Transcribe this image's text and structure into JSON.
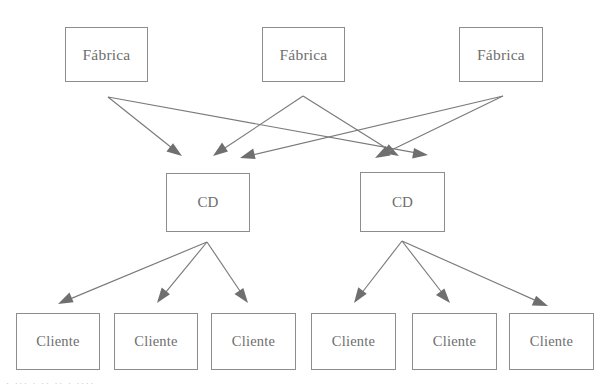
{
  "diagram": {
    "type": "supply-chain-network",
    "title": "",
    "canvas": {
      "width": 614,
      "height": 392,
      "background": "#ffffff"
    },
    "style": {
      "box_border_color": "#8d8d8d",
      "box_fill_color": "#ffffff",
      "text_color": "#6e6e6e",
      "edge_color": "#7a7a7a",
      "arrowhead_color": "#6f6f6f"
    },
    "tiers": [
      {
        "name": "factories",
        "label_singular": "Fábrica",
        "nodes": [
          {
            "id": "f1",
            "label": "Fábrica",
            "x": 65,
            "y": 27,
            "w": 83,
            "h": 55
          },
          {
            "id": "f2",
            "label": "Fábrica",
            "x": 262,
            "y": 27,
            "w": 83,
            "h": 55
          },
          {
            "id": "f3",
            "label": "Fábrica",
            "x": 459,
            "y": 27,
            "w": 84,
            "h": 55
          }
        ]
      },
      {
        "name": "distribution_centers",
        "label_singular": "CD",
        "nodes": [
          {
            "id": "cd1",
            "label": "CD",
            "x": 166,
            "y": 173,
            "w": 84,
            "h": 59
          },
          {
            "id": "cd2",
            "label": "CD",
            "x": 360,
            "y": 172,
            "w": 85,
            "h": 60
          }
        ]
      },
      {
        "name": "customers",
        "label_singular": "Cliente",
        "nodes": [
          {
            "id": "c1",
            "label": "Cliente",
            "x": 16,
            "y": 313,
            "w": 84,
            "h": 57
          },
          {
            "id": "c2",
            "label": "Cliente",
            "x": 114,
            "y": 313,
            "w": 84,
            "h": 57
          },
          {
            "id": "c3",
            "label": "Cliente",
            "x": 211,
            "y": 313,
            "w": 85,
            "h": 57
          },
          {
            "id": "c4",
            "label": "Cliente",
            "x": 311,
            "y": 313,
            "w": 85,
            "h": 57
          },
          {
            "id": "c5",
            "label": "Cliente",
            "x": 412,
            "y": 313,
            "w": 85,
            "h": 57
          },
          {
            "id": "c6",
            "label": "Cliente",
            "x": 509,
            "y": 313,
            "w": 85,
            "h": 57
          }
        ]
      }
    ],
    "edges": [
      {
        "from": "f1",
        "to": "cd1",
        "x1": 108,
        "y1": 97,
        "x2": 182,
        "y2": 156
      },
      {
        "from": "f1",
        "to": "cd2",
        "x1": 108,
        "y1": 97,
        "x2": 428,
        "y2": 155
      },
      {
        "from": "f2",
        "to": "cd1",
        "x1": 303,
        "y1": 96,
        "x2": 213,
        "y2": 156
      },
      {
        "from": "f2",
        "to": "cd2",
        "x1": 303,
        "y1": 96,
        "x2": 399,
        "y2": 156
      },
      {
        "from": "f3",
        "to": "cd1",
        "x1": 503,
        "y1": 96,
        "x2": 240,
        "y2": 158
      },
      {
        "from": "f3",
        "to": "cd2",
        "x1": 503,
        "y1": 96,
        "x2": 375,
        "y2": 158
      },
      {
        "from": "cd1",
        "to": "c1",
        "x1": 207,
        "y1": 242,
        "x2": 58,
        "y2": 304
      },
      {
        "from": "cd1",
        "to": "c2",
        "x1": 207,
        "y1": 242,
        "x2": 157,
        "y2": 303
      },
      {
        "from": "cd1",
        "to": "c3",
        "x1": 207,
        "y1": 242,
        "x2": 248,
        "y2": 303
      },
      {
        "from": "cd2",
        "to": "c4",
        "x1": 402,
        "y1": 241,
        "x2": 354,
        "y2": 303
      },
      {
        "from": "cd2",
        "to": "c5",
        "x1": 402,
        "y1": 241,
        "x2": 450,
        "y2": 303
      },
      {
        "from": "cd2",
        "to": "c6",
        "x1": 402,
        "y1": 241,
        "x2": 548,
        "y2": 306
      }
    ],
    "caption_fragment": "·  ···   ·  ··  ·· ·   ····"
  }
}
